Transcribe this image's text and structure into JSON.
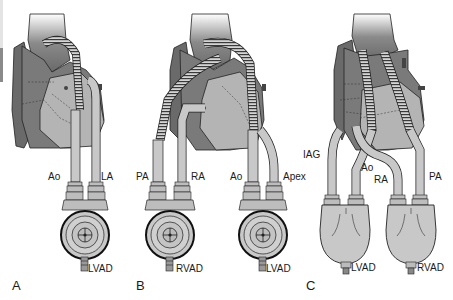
{
  "figure": {
    "colors": {
      "heart_dark": "#6f6f6f",
      "heart_mid": "#8c8c8c",
      "heart_light": "#b9b9b9",
      "cannula": "#c8c8c8",
      "outline": "#222222",
      "background": "#ffffff"
    },
    "panels": [
      {
        "id": "A",
        "letter": "A",
        "cannula_labels": [
          "Ao",
          "LA"
        ],
        "device_label": "LVAD",
        "device_type": "paracorporeal-round-pump"
      },
      {
        "id": "B",
        "letter": "B",
        "cannula_labels": [
          "PA",
          "RA",
          "Ao",
          "Apex"
        ],
        "device_labels": [
          "RVAD",
          "LVAD"
        ],
        "device_type": "paracorporeal-round-pump"
      },
      {
        "id": "C",
        "letter": "C",
        "cannula_labels": [
          "IAG",
          "Ao",
          "RA",
          "PA"
        ],
        "device_labels": [
          "LVAD",
          "RVAD"
        ],
        "device_type": "paracorporeal-sac-pump"
      }
    ]
  }
}
